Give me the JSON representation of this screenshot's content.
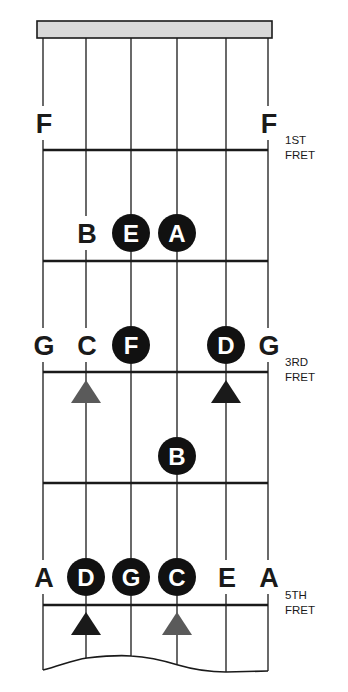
{
  "colors": {
    "line": "#1a1a1a",
    "nut_fill": "#d9d9d9",
    "dot_fill": "#111111",
    "dot_text": "#ffffff",
    "marker_dark": "#1a1a1a",
    "marker_gray": "#5a5a5a"
  },
  "strings_x": [
    43,
    86,
    131,
    177,
    226,
    268
  ],
  "frets": [
    {
      "y": 150,
      "label_line1": "1ST",
      "label_line2": "FRET"
    },
    {
      "y": 261,
      "label_line1": "",
      "label_line2": ""
    },
    {
      "y": 372,
      "label_line1": "3RD",
      "label_line2": "FRET"
    },
    {
      "y": 483,
      "label_line1": "",
      "label_line2": ""
    },
    {
      "y": 605,
      "label_line1": "5TH",
      "label_line2": "FRET"
    }
  ],
  "notes": [
    {
      "name": "F",
      "string": 0,
      "y": 123,
      "style": "plain"
    },
    {
      "name": "F",
      "string": 5,
      "y": 123,
      "style": "plain"
    },
    {
      "name": "B",
      "string": 1,
      "y": 233,
      "style": "plain"
    },
    {
      "name": "E",
      "string": 2,
      "y": 233,
      "style": "dot"
    },
    {
      "name": "A",
      "string": 3,
      "y": 233,
      "style": "dot"
    },
    {
      "name": "G",
      "string": 0,
      "y": 345,
      "style": "plain"
    },
    {
      "name": "C",
      "string": 1,
      "y": 345,
      "style": "plain"
    },
    {
      "name": "F",
      "string": 2,
      "y": 345,
      "style": "dot"
    },
    {
      "name": "D",
      "string": 4,
      "y": 345,
      "style": "dot"
    },
    {
      "name": "G",
      "string": 5,
      "y": 345,
      "style": "plain"
    },
    {
      "name": "B",
      "string": 3,
      "y": 456,
      "style": "dot"
    },
    {
      "name": "A",
      "string": 0,
      "y": 577,
      "style": "plain"
    },
    {
      "name": "D",
      "string": 1,
      "y": 577,
      "style": "dot"
    },
    {
      "name": "G",
      "string": 2,
      "y": 577,
      "style": "dot"
    },
    {
      "name": "C",
      "string": 3,
      "y": 577,
      "style": "dot"
    },
    {
      "name": "E",
      "string": 4,
      "y": 577,
      "style": "plain"
    },
    {
      "name": "A",
      "string": 5,
      "y": 577,
      "style": "plain"
    }
  ],
  "markers": [
    {
      "string": 1,
      "top": 380,
      "shade": "gray"
    },
    {
      "string": 4,
      "top": 380,
      "shade": "dark"
    },
    {
      "string": 1,
      "top": 612,
      "shade": "dark"
    },
    {
      "string": 3,
      "top": 612,
      "shade": "gray"
    }
  ]
}
